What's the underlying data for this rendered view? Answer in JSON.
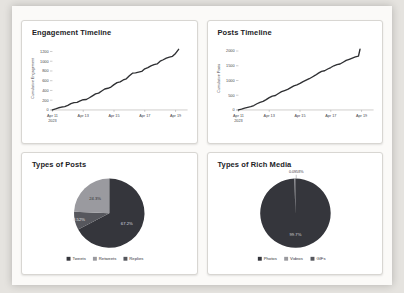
{
  "page": {
    "background": "#e5e3df",
    "card_background": "#ffffff",
    "accent_dark": "#35363c",
    "accent_gray": "#9a9a9f",
    "accent_mid": "#56575d"
  },
  "chart_data": [
    {
      "type": "line",
      "title": "Engagement Timeline",
      "ylabel": "Cumulative Engagement",
      "yticks": [
        0,
        200,
        400,
        600,
        800,
        1000,
        1200
      ],
      "ymax": 1300,
      "xmax": 8.4,
      "xticks": [
        {
          "label": "Apr 11",
          "sub": "2023",
          "x": 0
        },
        {
          "label": "Apr 13",
          "x": 2
        },
        {
          "label": "Apr 15",
          "x": 4
        },
        {
          "label": "Apr 17",
          "x": 6
        },
        {
          "label": "Apr 19",
          "x": 8
        }
      ],
      "color": "#2f3033",
      "x": [
        0,
        0.2,
        0.4,
        0.6,
        0.8,
        1,
        1.2,
        1.4,
        1.6,
        1.8,
        2,
        2.2,
        2.4,
        2.6,
        2.8,
        3,
        3.2,
        3.4,
        3.6,
        3.8,
        4,
        4.2,
        4.4,
        4.6,
        4.8,
        5,
        5.2,
        5.4,
        5.6,
        5.8,
        6,
        6.2,
        6.4,
        6.6,
        6.8,
        7,
        7.2,
        7.4,
        7.6,
        7.8,
        8,
        8.2
      ],
      "y": [
        0,
        20,
        45,
        60,
        70,
        95,
        130,
        150,
        155,
        185,
        210,
        215,
        250,
        290,
        330,
        345,
        390,
        430,
        445,
        470,
        520,
        560,
        575,
        615,
        640,
        700,
        755,
        760,
        775,
        790,
        845,
        870,
        905,
        930,
        945,
        1000,
        1030,
        1065,
        1085,
        1100,
        1160,
        1245
      ]
    },
    {
      "type": "line",
      "title": "Posts Timeline",
      "ylabel": "Cumulative Posts",
      "yticks": [
        0,
        500,
        1000,
        1500,
        2000
      ],
      "ymax": 2150,
      "xmax": 8.4,
      "xticks": [
        {
          "label": "Apr 11",
          "sub": "2023",
          "x": 0
        },
        {
          "label": "Apr 13",
          "x": 2
        },
        {
          "label": "Apr 15",
          "x": 4
        },
        {
          "label": "Apr 17",
          "x": 6
        },
        {
          "label": "Apr 19",
          "x": 8
        }
      ],
      "color": "#2f3033",
      "x": [
        0,
        0.2,
        0.4,
        0.6,
        0.8,
        1,
        1.2,
        1.4,
        1.6,
        1.8,
        2,
        2.2,
        2.4,
        2.6,
        2.8,
        3,
        3.2,
        3.4,
        3.6,
        3.8,
        4,
        4.2,
        4.4,
        4.6,
        4.8,
        5,
        5.2,
        5.4,
        5.6,
        5.8,
        6,
        6.2,
        6.4,
        6.6,
        6.8,
        7,
        7.2,
        7.4,
        7.6,
        7.8,
        7.9
      ],
      "y": [
        0,
        25,
        60,
        90,
        110,
        150,
        210,
        260,
        290,
        350,
        420,
        470,
        490,
        560,
        620,
        660,
        700,
        760,
        820,
        850,
        900,
        960,
        1010,
        1060,
        1120,
        1180,
        1250,
        1310,
        1330,
        1390,
        1440,
        1500,
        1540,
        1560,
        1620,
        1680,
        1720,
        1760,
        1800,
        1830,
        2060
      ]
    },
    {
      "type": "pie",
      "title": "Types of Posts",
      "slices": [
        {
          "label": "Tweets",
          "value": 67.2,
          "text": "67.2%",
          "color": "#35363c",
          "text_color": "#dddde0",
          "lr": 0.58
        },
        {
          "label": "Replies",
          "value": 8.52,
          "text": "8.52%",
          "color": "#56575d",
          "text_color": "#e6e6e9",
          "lr": 0.88
        },
        {
          "label": "Retweets",
          "value": 24.3,
          "text": "24.3%",
          "color": "#9a9a9f",
          "text_color": "#2c2c30",
          "lr": 0.58
        }
      ],
      "legend": [
        {
          "label": "Tweets",
          "color": "#35363c"
        },
        {
          "label": "Retweets",
          "color": "#9a9a9f"
        },
        {
          "label": "Replies",
          "color": "#56575d"
        }
      ]
    },
    {
      "type": "pie",
      "title": "Types of Rich Media",
      "slices": [
        {
          "label": "Photos",
          "value": 99.7,
          "text": "99.7%",
          "color": "#35363c",
          "text_color": "#d6d6d9",
          "lr": 0.62
        },
        {
          "label": "Videos",
          "value": 0.204,
          "text": "",
          "color": "#9a9a9f",
          "text_color": "#ffffff",
          "lr": 0
        },
        {
          "label": "GIFs",
          "value": 0.0958,
          "text": "",
          "color": "#56575d",
          "text_color": "#ffffff",
          "lr": 0
        }
      ],
      "callout": {
        "text": "0.0958%"
      },
      "legend": [
        {
          "label": "Photos",
          "color": "#35363c"
        },
        {
          "label": "Videos",
          "color": "#9a9a9f"
        },
        {
          "label": "GIFs",
          "color": "#56575d"
        }
      ]
    }
  ]
}
